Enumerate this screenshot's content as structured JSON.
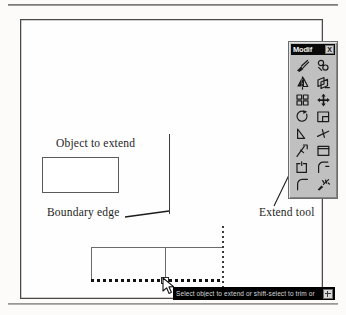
{
  "figure": {
    "annotations": {
      "object_to_extend": "Object to extend",
      "boundary_edge": "Boundary edge",
      "extend_tool": "Extend tool"
    }
  },
  "palette": {
    "title": "Modif",
    "close_label": "X",
    "tools": [
      {
        "name": "erase-tool",
        "label": "Erase"
      },
      {
        "name": "copy-object-tool",
        "label": "Copy Object"
      },
      {
        "name": "mirror-tool",
        "label": "Mirror"
      },
      {
        "name": "offset-tool",
        "label": "Offset"
      },
      {
        "name": "array-tool",
        "label": "Array"
      },
      {
        "name": "move-tool",
        "label": "Move"
      },
      {
        "name": "rotate-tool",
        "label": "Rotate"
      },
      {
        "name": "scale-tool",
        "label": "Scale"
      },
      {
        "name": "stretch-tool",
        "label": "Stretch"
      },
      {
        "name": "lengthen-tool",
        "label": "Lengthen"
      },
      {
        "name": "trim-tool",
        "label": "Trim"
      },
      {
        "name": "extend-tool",
        "label": "Extend"
      },
      {
        "name": "break-at-point-tool",
        "label": "Break at Point"
      },
      {
        "name": "break-tool",
        "label": "Break"
      },
      {
        "name": "chamfer-tool",
        "label": "Chamfer"
      },
      {
        "name": "fillet-tool",
        "label": "Fillet"
      },
      {
        "name": "explode-tool",
        "label": "Explode"
      }
    ]
  },
  "command_prompt": {
    "text": "Select object to extend or shift-select to trim or",
    "button_icon": "maximize-icon"
  },
  "colors": {
    "palette_face": "#c0c0c0",
    "prompt_background": "#000000",
    "prompt_text": "#d8d8d8",
    "ink": "#1b1b1b",
    "frame": "#4a4a4a"
  }
}
